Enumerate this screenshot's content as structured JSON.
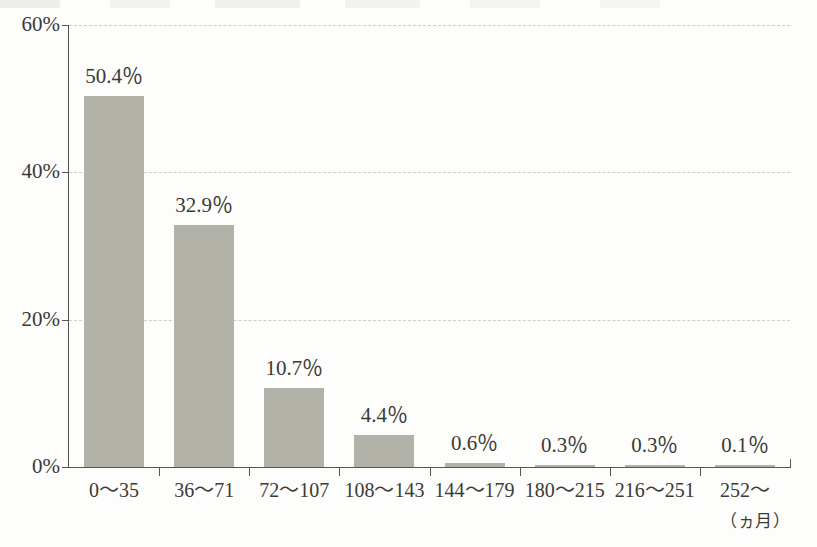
{
  "chart_data": {
    "type": "bar",
    "title": "",
    "subtitle": "",
    "xlabel": "（ヵ月）",
    "ylabel": "",
    "categories": [
      "0〜35",
      "36〜71",
      "72〜107",
      "108〜143",
      "144〜179",
      "180〜215",
      "216〜251",
      "252〜"
    ],
    "values": [
      50.4,
      32.9,
      10.7,
      4.4,
      0.6,
      0.3,
      0.3,
      0.1
    ],
    "data_labels": [
      "50.4％",
      "32.9％",
      "10.7％",
      "4.4％",
      "0.6％",
      "0.3％",
      "0.3％",
      "0.1％"
    ],
    "ylim": [
      0,
      60
    ],
    "yticks": [
      0,
      20,
      40,
      60
    ],
    "ytick_labels": [
      "0%",
      "20%",
      "40%",
      "60%"
    ],
    "grid": true,
    "grid_axis": "y",
    "grid_style": "dashed",
    "legend": false,
    "legend_position": "none",
    "bar_color": "#b2b2a9",
    "axis_color": "#55554e",
    "grid_color": "#cfcdbd",
    "text_color": "#3a3a36",
    "background_color": "#fdfdfb"
  },
  "axis": {
    "unit_note": "（ヵ月）"
  }
}
